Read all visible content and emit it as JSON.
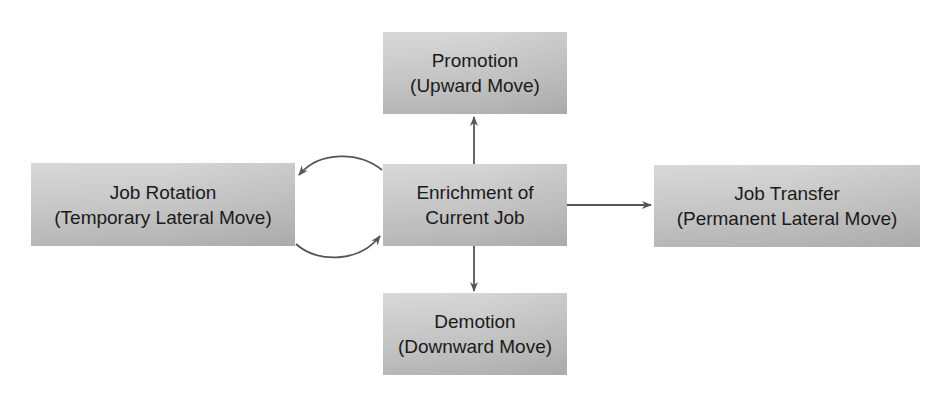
{
  "diagram": {
    "nodes": [
      {
        "id": "promotion",
        "line1": "Promotion",
        "line2": "(Upward Move)"
      },
      {
        "id": "enrichment",
        "line1": "Enrichment of",
        "line2": "Current Job"
      },
      {
        "id": "demotion",
        "line1": "Demotion",
        "line2": "(Downward Move)"
      },
      {
        "id": "rotation",
        "line1": "Job Rotation",
        "line2": "(Temporary Lateral Move)"
      },
      {
        "id": "transfer",
        "line1": "Job Transfer",
        "line2": "(Permanent Lateral Move)"
      }
    ],
    "edges": [
      {
        "from": "enrichment",
        "to": "promotion",
        "type": "straight-arrow"
      },
      {
        "from": "enrichment",
        "to": "demotion",
        "type": "straight-arrow"
      },
      {
        "from": "enrichment",
        "to": "transfer",
        "type": "straight-arrow"
      },
      {
        "from": "enrichment",
        "to": "rotation",
        "type": "curved-arrow"
      },
      {
        "from": "rotation",
        "to": "enrichment",
        "type": "curved-arrow"
      }
    ],
    "colors": {
      "box_top": "#d6d6d6",
      "box_bottom": "#b3b3b3",
      "arrow": "#555555",
      "text": "#1a1a1a"
    }
  }
}
